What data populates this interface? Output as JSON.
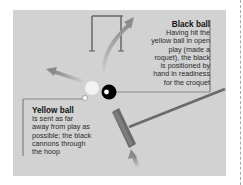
{
  "diagram": {
    "colors": {
      "panel_bg": "#d2d2d2",
      "leader_line": "#8a8a8a",
      "hoop": "#6e6e6e",
      "arrow": "#8c8c8c",
      "mallet": "#6a6a6a",
      "black_ball": "#000000",
      "yellow_ball": "#f2f2f2"
    },
    "black_ball": {
      "title": "Black ball",
      "lines": [
        "Having hit the",
        "yellow ball in open",
        "play (made a",
        "roquet), the black",
        "is positioned by",
        "hand in readiness",
        "for the croquet"
      ]
    },
    "yellow_ball": {
      "title": "Yellow ball",
      "lines": [
        "Is sent as far",
        "away from play as",
        "possible; the black",
        "cannons through",
        "the hoop"
      ]
    },
    "icons": [
      "hoop-icon",
      "mallet-icon",
      "arrow-icon",
      "ball-icon"
    ]
  }
}
